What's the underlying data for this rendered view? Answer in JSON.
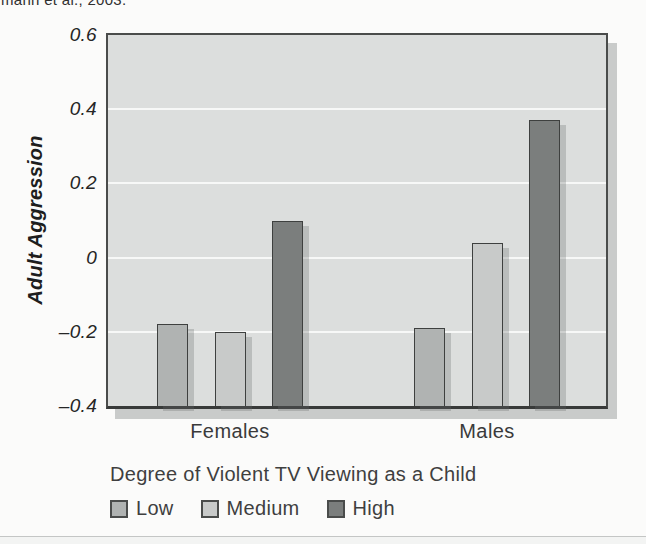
{
  "page": {
    "caption_fragment": "mann et al., 2003.",
    "background_color": "#fbfbfa"
  },
  "chart_data": {
    "type": "bar",
    "title": "",
    "ylabel": "Adult Aggression",
    "xlabel": "",
    "categories": [
      "Females",
      "Males"
    ],
    "series": [
      {
        "name": "Low",
        "values": [
          -0.18,
          -0.19
        ],
        "color": "#b0b3b2"
      },
      {
        "name": "Medium",
        "values": [
          -0.2,
          0.04
        ],
        "color": "#c8cac9"
      },
      {
        "name": "High",
        "values": [
          0.1,
          0.37
        ],
        "color": "#7b7e7d"
      }
    ],
    "ylim": [
      -0.4,
      0.6
    ],
    "yticks": [
      0.6,
      0.4,
      0.2,
      0,
      -0.2,
      -0.4
    ],
    "ytick_labels": [
      "0.6",
      "0.4",
      "0.2",
      "0",
      "–0.2",
      "–0.4"
    ],
    "gridline_values": [
      0.4,
      0.2,
      0,
      -0.2
    ],
    "bar_baseline": -0.4,
    "grid": true,
    "legend_title": "Degree of Violent TV Viewing as a Child",
    "legend_entries": [
      "Low",
      "Medium",
      "High"
    ],
    "legend_position": "bottom-left",
    "colors": {
      "plot_background": "#dcdedd",
      "gridline": "#f7f8f7",
      "plot_border": "#4a4c4b",
      "bar_border": "#3e403f",
      "shadow": "#c9cbca",
      "text": "#2f2f2f"
    }
  }
}
